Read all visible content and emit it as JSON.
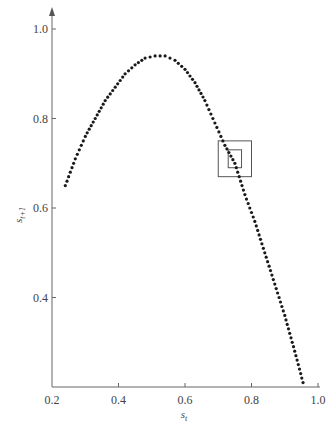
{
  "chart_data": {
    "type": "scatter",
    "title": "",
    "xlabel": "s_t",
    "ylabel": "s_{t+1}",
    "xlim": [
      0.2,
      1.0
    ],
    "ylim": [
      0.2,
      1.0
    ],
    "x_ticks": [
      0.2,
      0.4,
      0.6,
      0.8,
      1.0
    ],
    "y_ticks": [
      0.4,
      0.6,
      0.8,
      1.0
    ],
    "x_tick_labels": [
      "0.2",
      "0.4",
      "0.6",
      "0.8",
      "1.0"
    ],
    "y_tick_labels": [
      "0.4",
      "0.6",
      "0.8",
      "1.0"
    ],
    "grid": false,
    "legend": null,
    "series": [
      {
        "name": "return map",
        "marker": "dot",
        "color": "#1a1a1a",
        "curve": "hump (logistic-like)",
        "x": [
          0.24,
          0.27,
          0.3,
          0.33,
          0.36,
          0.39,
          0.42,
          0.45,
          0.48,
          0.51,
          0.54,
          0.57,
          0.6,
          0.63,
          0.66,
          0.69,
          0.72,
          0.75,
          0.78,
          0.81,
          0.84,
          0.87,
          0.9,
          0.93,
          0.955
        ],
        "y": [
          0.65,
          0.71,
          0.76,
          0.8,
          0.84,
          0.87,
          0.9,
          0.92,
          0.935,
          0.94,
          0.94,
          0.93,
          0.91,
          0.88,
          0.84,
          0.79,
          0.74,
          0.7,
          0.63,
          0.57,
          0.5,
          0.43,
          0.36,
          0.28,
          0.21
        ]
      }
    ],
    "annotations": [
      {
        "type": "box",
        "name": "outer-box",
        "x": [
          0.7,
          0.8
        ],
        "y": [
          0.67,
          0.75
        ]
      },
      {
        "type": "box",
        "name": "inner-box",
        "x": [
          0.73,
          0.77
        ],
        "y": [
          0.69,
          0.73
        ]
      }
    ]
  },
  "axes": {
    "xlabel_main": "s",
    "xlabel_sub": "t",
    "ylabel_main": "s",
    "ylabel_sub": "t+1"
  }
}
